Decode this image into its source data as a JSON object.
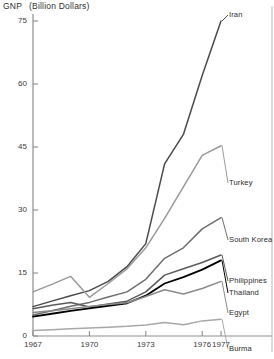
{
  "chart_data": {
    "type": "line",
    "title_main": "GNP",
    "title_unit": "(Billion Dollars)",
    "xlabel": "",
    "ylabel": "GNP (Billion Dollars)",
    "xlim": [
      1967,
      1977
    ],
    "ylim": [
      0,
      75
    ],
    "grid": false,
    "legend_position": "right-inline-labels",
    "x": [
      1967,
      1968,
      1969,
      1970,
      1971,
      1972,
      1973,
      1974,
      1975,
      1976,
      1977
    ],
    "xticks": [
      1967,
      1970,
      1973,
      1976,
      1977
    ],
    "xtick_labels": [
      "1967",
      "1970",
      "1973",
      "1976",
      "1977"
    ],
    "yticks": [
      0,
      15,
      30,
      45,
      60,
      75
    ],
    "ytick_labels": [
      "0",
      "15",
      "30",
      "45",
      "60",
      "75"
    ],
    "series": [
      {
        "name": "Iran",
        "color": "#4a4a4a",
        "width": 1.5,
        "values": [
          7.0,
          8.3,
          9.6,
          10.8,
          13.0,
          16.5,
          22.0,
          41.0,
          48.0,
          62.0,
          75.0
        ]
      },
      {
        "name": "Turkey",
        "color": "#9a9a9a",
        "width": 1.5,
        "values": [
          10.5,
          12.3,
          14.2,
          9.2,
          12.5,
          16.0,
          21.0,
          28.0,
          35.5,
          43.0,
          45.3
        ]
      },
      {
        "name": "South Korea",
        "color": "#6e6e6e",
        "width": 1.5,
        "values": [
          5.0,
          6.0,
          7.1,
          8.0,
          9.3,
          10.5,
          13.5,
          18.5,
          21.0,
          25.5,
          28.2
        ]
      },
      {
        "name": "Philippines",
        "color": "#5a5a5a",
        "width": 1.5,
        "values": [
          6.5,
          7.3,
          8.0,
          6.9,
          7.6,
          8.3,
          10.5,
          14.5,
          16.0,
          17.5,
          19.3
        ]
      },
      {
        "name": "Thailand",
        "color": "#000000",
        "width": 1.8,
        "values": [
          4.6,
          5.3,
          6.0,
          6.6,
          7.2,
          7.8,
          9.6,
          12.5,
          14.0,
          15.8,
          18.0
        ]
      },
      {
        "name": "Egypt",
        "color": "#8a8a8a",
        "width": 1.5,
        "values": [
          5.6,
          6.0,
          6.5,
          7.0,
          7.5,
          7.9,
          9.4,
          11.0,
          10.0,
          11.3,
          13.0
        ]
      },
      {
        "name": "Burma",
        "color": "#a8a8a8",
        "width": 1.5,
        "values": [
          1.3,
          1.5,
          1.7,
          1.9,
          2.1,
          2.3,
          2.6,
          3.2,
          2.7,
          3.6,
          4.0
        ]
      }
    ],
    "annotations": [
      {
        "name": "Iran",
        "text": "Iran"
      },
      {
        "name": "Turkey",
        "text": "Turkey"
      },
      {
        "name": "South Korea",
        "text": "South Korea"
      },
      {
        "name": "Philippines",
        "text": "Philippines"
      },
      {
        "name": "Thailand",
        "text": "Thailand"
      },
      {
        "name": "Egypt",
        "text": "Egypt"
      },
      {
        "name": "Burma",
        "text": "Burma"
      }
    ]
  }
}
